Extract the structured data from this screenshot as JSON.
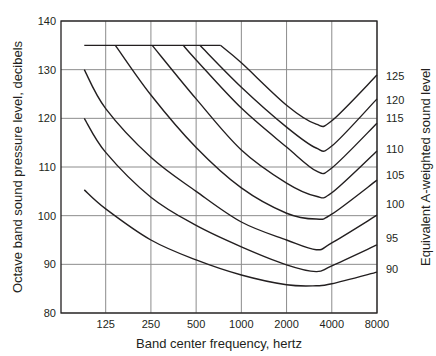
{
  "chart_data": {
    "type": "line",
    "title": "",
    "xlabel": "Band center frequency, hertz",
    "ylabel": "Octave band sound pressure level, decibels",
    "y2label": "Equivalent A-weighted sound level",
    "x_scale": "log2",
    "x_ticks": [
      125,
      250,
      500,
      1000,
      2000,
      4000,
      8000
    ],
    "x_tick_labels": [
      "125",
      "250",
      "500",
      "1000",
      "2000",
      "4000",
      "8000"
    ],
    "xlim": [
      63,
      8000
    ],
    "y_ticks": [
      80,
      90,
      100,
      110,
      120,
      130,
      140
    ],
    "y_tick_labels": [
      "80",
      "90",
      "100",
      "110",
      "120",
      "130",
      "140"
    ],
    "ylim": [
      80,
      140
    ],
    "grid": true,
    "legend_position": "right-axis labels",
    "series": [
      {
        "name": "90",
        "label_y": 89,
        "points": [
          [
            90,
            105.3
          ],
          [
            125,
            101.4
          ],
          [
            250,
            95.0
          ],
          [
            500,
            90.9
          ],
          [
            1000,
            87.8
          ],
          [
            2000,
            85.8
          ],
          [
            3150,
            85.6
          ],
          [
            4000,
            86.0
          ],
          [
            8000,
            88.4
          ]
        ]
      },
      {
        "name": "95",
        "label_y": 95.5,
        "points": [
          [
            90,
            120.0
          ],
          [
            125,
            113.0
          ],
          [
            250,
            103.8
          ],
          [
            500,
            98.0
          ],
          [
            1000,
            93.6
          ],
          [
            2000,
            89.9
          ],
          [
            3150,
            88.5
          ],
          [
            4000,
            89.7
          ],
          [
            8000,
            94.0
          ]
        ]
      },
      {
        "name": "100",
        "label_y": 102.5,
        "points": [
          [
            90,
            130.0
          ],
          [
            125,
            122.0
          ],
          [
            250,
            112.0
          ],
          [
            500,
            105.0
          ],
          [
            1000,
            98.7
          ],
          [
            2000,
            95.0
          ],
          [
            3150,
            93.0
          ],
          [
            4000,
            94.4
          ],
          [
            8000,
            100.1
          ]
        ]
      },
      {
        "name": "105",
        "label_y": 108.3,
        "points": [
          [
            90,
            135.0
          ],
          [
            145,
            135.0
          ],
          [
            250,
            124.8
          ],
          [
            500,
            114.0
          ],
          [
            1000,
            105.7
          ],
          [
            2000,
            100.5
          ],
          [
            3150,
            99.3
          ],
          [
            4000,
            100.3
          ],
          [
            8000,
            107.3
          ]
        ]
      },
      {
        "name": "110",
        "label_y": 113.6,
        "points": [
          [
            255,
            135.0
          ],
          [
            500,
            124.0
          ],
          [
            1000,
            113.5
          ],
          [
            2000,
            106.7
          ],
          [
            3150,
            104.0
          ],
          [
            4000,
            104.7
          ],
          [
            8000,
            113.3
          ]
        ]
      },
      {
        "name": "115",
        "label_y": 120.0,
        "points": [
          [
            410,
            135.0
          ],
          [
            500,
            132.0
          ],
          [
            1000,
            122.1
          ],
          [
            2000,
            114.1
          ],
          [
            3150,
            109.2
          ],
          [
            4000,
            109.8
          ],
          [
            8000,
            119.0
          ]
        ]
      },
      {
        "name": "120",
        "label_y": 123.7,
        "points": [
          [
            530,
            135.0
          ],
          [
            1000,
            126.4
          ],
          [
            2000,
            118.2
          ],
          [
            3150,
            113.9
          ],
          [
            4000,
            114.3
          ],
          [
            8000,
            124.0
          ]
        ]
      },
      {
        "name": "125",
        "label_y": 128.6,
        "points": [
          [
            725,
            135.0
          ],
          [
            1000,
            131.4
          ],
          [
            2000,
            122.7
          ],
          [
            3150,
            118.8
          ],
          [
            4000,
            119.5
          ],
          [
            8000,
            128.9
          ]
        ]
      }
    ],
    "plateau": {
      "level": 135,
      "from_hz": 90,
      "to_hz": 725
    }
  },
  "layout": {
    "plot": {
      "left": 61,
      "top": 21,
      "right": 377,
      "bottom": 313
    },
    "colors": {
      "line": "#231f20",
      "grid": "#8c8c8c",
      "background": "#ffffff"
    }
  }
}
